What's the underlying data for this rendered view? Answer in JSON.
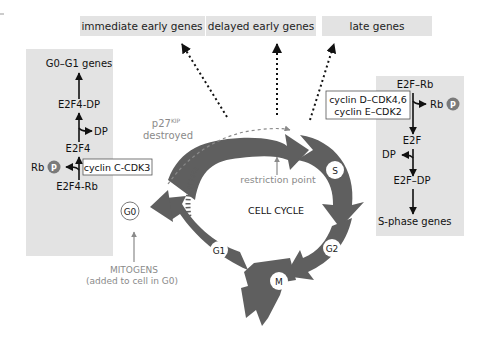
{
  "top_boxes": [
    {
      "label": "immediate early genes"
    },
    {
      "label": "delayed early genes"
    },
    {
      "label": "late genes"
    }
  ],
  "left_panel": {
    "top": "G0–G1 genes",
    "mid": "E2F4-DP",
    "dp": "DP",
    "e2f4": "E2F4",
    "rb": "Rb",
    "p": "P",
    "enzyme": "cyclin C-CDK3",
    "bottom": "E2F4-Rb"
  },
  "right_panel": {
    "top": "E2F–Rb",
    "rb": "Rb",
    "p": "P",
    "enzyme_line1": "cyclin D–CDK4,6",
    "enzyme_line2": "cyclin E–CDK2",
    "e2f": "E2F",
    "dp": "DP",
    "e2f_dp": "E2F–DP",
    "bottom": "S-phase genes"
  },
  "cycle": {
    "title": "CELL CYCLE",
    "phases": {
      "g0": "G0",
      "g1": "G1",
      "s": "S",
      "g2": "G2",
      "m": "M"
    },
    "restriction": "restriction point",
    "p27_line1": "p27",
    "p27_sup": "KIP",
    "p27_line2": "destroyed",
    "mitogens_line1": "MITOGENS",
    "mitogens_line2": "(added to cell in G0)"
  },
  "colors": {
    "arrow": "#5f5f5f",
    "panel": "#e3e3e3",
    "gray_text": "#8a8a8a",
    "phosphate": "#7a7a7a"
  }
}
